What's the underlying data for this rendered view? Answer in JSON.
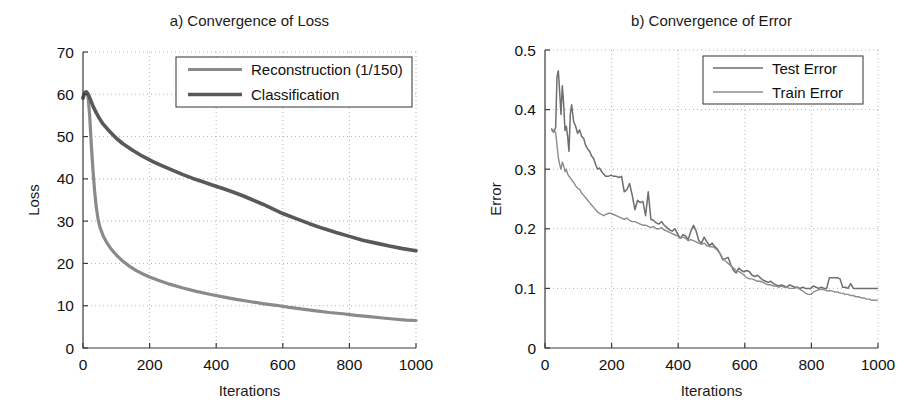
{
  "figure": {
    "background": "#ffffff",
    "width": 918,
    "height": 418
  },
  "chart_data": [
    {
      "type": "line",
      "panel_id": "a",
      "title": "a) Convergence of Loss",
      "xlabel": "Iterations",
      "ylabel": "Loss",
      "xlim": [
        0,
        1000
      ],
      "ylim": [
        0,
        70
      ],
      "xticks": [
        0,
        200,
        400,
        600,
        800,
        1000
      ],
      "xticklabels": [
        "0",
        "200",
        "400",
        "600",
        "800",
        "1000"
      ],
      "yticks": [
        0,
        10,
        20,
        30,
        40,
        50,
        60,
        70
      ],
      "yticklabels": [
        "0",
        "10",
        "20",
        "30",
        "40",
        "50",
        "60",
        "70"
      ],
      "grid": true,
      "legend_position": "upper-right",
      "series": [
        {
          "name": "Reconstruction (1/150)",
          "color": "#8a8a8a",
          "width": 3.2,
          "x": [
            0,
            5,
            10,
            15,
            20,
            25,
            30,
            35,
            40,
            45,
            50,
            60,
            70,
            80,
            90,
            100,
            120,
            140,
            160,
            180,
            200,
            230,
            260,
            300,
            340,
            380,
            420,
            460,
            500,
            540,
            580,
            620,
            660,
            700,
            740,
            780,
            820,
            860,
            900,
            940,
            970,
            1000
          ],
          "y": [
            59.0,
            60.3,
            60.5,
            59.6,
            55.0,
            48.0,
            42.0,
            37.0,
            33.2,
            30.6,
            28.8,
            26.6,
            25.1,
            23.9,
            22.9,
            22.0,
            20.5,
            19.3,
            18.3,
            17.5,
            16.8,
            15.9,
            15.1,
            14.2,
            13.4,
            12.7,
            12.1,
            11.5,
            11.0,
            10.5,
            10.1,
            9.6,
            9.2,
            8.8,
            8.4,
            8.1,
            7.7,
            7.4,
            7.1,
            6.8,
            6.6,
            6.5
          ]
        },
        {
          "name": "Classification",
          "color": "#595959",
          "width": 3.6,
          "x": [
            0,
            5,
            10,
            15,
            20,
            25,
            30,
            40,
            50,
            60,
            80,
            100,
            120,
            150,
            180,
            210,
            240,
            270,
            300,
            330,
            360,
            390,
            420,
            450,
            480,
            510,
            540,
            570,
            600,
            640,
            680,
            720,
            760,
            800,
            840,
            880,
            920,
            960,
            1000
          ],
          "y": [
            59.2,
            60.4,
            60.6,
            60.1,
            59.2,
            58.2,
            57.2,
            55.6,
            54.2,
            53.0,
            51.2,
            49.6,
            48.3,
            46.7,
            45.3,
            44.1,
            43.0,
            42.0,
            41.0,
            40.1,
            39.3,
            38.5,
            37.7,
            36.9,
            36.0,
            35.0,
            34.0,
            32.9,
            31.8,
            30.6,
            29.4,
            28.3,
            27.3,
            26.4,
            25.5,
            24.8,
            24.1,
            23.5,
            23.0
          ]
        }
      ]
    },
    {
      "type": "line",
      "panel_id": "b",
      "title": "b) Convergence of Error",
      "xlabel": "Iterations",
      "ylabel": "Error",
      "xlim": [
        0,
        1000
      ],
      "ylim": [
        0,
        0.5
      ],
      "xticks": [
        0,
        200,
        400,
        600,
        800,
        1000
      ],
      "xticklabels": [
        "0",
        "200",
        "400",
        "600",
        "800",
        "1000"
      ],
      "yticks": [
        0,
        0.1,
        0.2,
        0.3,
        0.4,
        0.5
      ],
      "yticklabels": [
        "0",
        "0.1",
        "0.2",
        "0.3",
        "0.4",
        "0.5"
      ],
      "grid": true,
      "legend_position": "upper-right",
      "series": [
        {
          "name": "Test Error",
          "color": "#6e6e6e",
          "width": 1.5,
          "x": [
            20,
            26,
            32,
            36,
            40,
            44,
            48,
            52,
            56,
            60,
            64,
            68,
            72,
            76,
            80,
            86,
            92,
            98,
            104,
            110,
            116,
            122,
            128,
            134,
            140,
            146,
            152,
            158,
            164,
            170,
            176,
            182,
            190,
            198,
            206,
            214,
            222,
            230,
            238,
            246,
            254,
            262,
            270,
            278,
            286,
            294,
            302,
            310,
            318,
            326,
            334,
            342,
            350,
            358,
            366,
            374,
            382,
            390,
            398,
            406,
            414,
            422,
            430,
            438,
            446,
            454,
            462,
            470,
            478,
            486,
            494,
            502,
            510,
            518,
            526,
            534,
            542,
            550,
            558,
            566,
            574,
            582,
            590,
            598,
            606,
            614,
            622,
            630,
            638,
            646,
            654,
            662,
            670,
            678,
            686,
            694,
            702,
            710,
            718,
            726,
            734,
            742,
            750,
            758,
            766,
            774,
            782,
            790,
            798,
            806,
            814,
            822,
            830,
            838,
            846,
            854,
            862,
            870,
            878,
            886,
            894,
            902,
            910,
            918,
            926,
            934,
            942,
            950,
            958,
            966,
            974,
            982,
            990,
            998
          ],
          "y": [
            0.366,
            0.362,
            0.37,
            0.455,
            0.465,
            0.43,
            0.392,
            0.44,
            0.41,
            0.365,
            0.372,
            0.355,
            0.33,
            0.392,
            0.408,
            0.38,
            0.372,
            0.36,
            0.366,
            0.355,
            0.352,
            0.34,
            0.334,
            0.33,
            0.322,
            0.318,
            0.308,
            0.3,
            0.302,
            0.296,
            0.292,
            0.288,
            0.288,
            0.29,
            0.288,
            0.288,
            0.286,
            0.288,
            0.262,
            0.266,
            0.276,
            0.256,
            0.232,
            0.248,
            0.244,
            0.246,
            0.222,
            0.262,
            0.216,
            0.214,
            0.21,
            0.208,
            0.212,
            0.206,
            0.202,
            0.198,
            0.196,
            0.2,
            0.192,
            0.184,
            0.19,
            0.188,
            0.182,
            0.196,
            0.206,
            0.196,
            0.18,
            0.176,
            0.186,
            0.178,
            0.172,
            0.176,
            0.17,
            0.166,
            0.158,
            0.148,
            0.15,
            0.152,
            0.14,
            0.13,
            0.126,
            0.134,
            0.13,
            0.128,
            0.13,
            0.128,
            0.122,
            0.12,
            0.122,
            0.118,
            0.114,
            0.112,
            0.11,
            0.112,
            0.108,
            0.106,
            0.104,
            0.106,
            0.104,
            0.102,
            0.106,
            0.104,
            0.102,
            0.102,
            0.1,
            0.102,
            0.1,
            0.1,
            0.1,
            0.104,
            0.102,
            0.1,
            0.102,
            0.1,
            0.1,
            0.118,
            0.118,
            0.118,
            0.118,
            0.116,
            0.102,
            0.102,
            0.1,
            0.108,
            0.1,
            0.1,
            0.1,
            0.1,
            0.1,
            0.1,
            0.1,
            0.1,
            0.1,
            0.1,
            0.1,
            0.104
          ]
        },
        {
          "name": "Train Error",
          "color": "#8c8c8c",
          "width": 1.4,
          "x": [
            20,
            26,
            32,
            36,
            40,
            44,
            48,
            52,
            56,
            60,
            64,
            68,
            72,
            76,
            80,
            86,
            92,
            98,
            104,
            110,
            116,
            122,
            128,
            134,
            140,
            146,
            152,
            158,
            164,
            170,
            176,
            182,
            190,
            198,
            206,
            214,
            222,
            230,
            238,
            246,
            254,
            262,
            270,
            278,
            286,
            294,
            302,
            310,
            318,
            326,
            334,
            342,
            350,
            358,
            366,
            374,
            382,
            390,
            398,
            406,
            414,
            422,
            430,
            438,
            446,
            454,
            462,
            470,
            478,
            486,
            494,
            502,
            510,
            518,
            526,
            534,
            542,
            550,
            558,
            566,
            574,
            582,
            590,
            598,
            606,
            614,
            622,
            630,
            638,
            646,
            654,
            662,
            670,
            678,
            686,
            694,
            702,
            710,
            718,
            726,
            734,
            742,
            750,
            758,
            766,
            774,
            782,
            790,
            798,
            806,
            814,
            822,
            830,
            838,
            846,
            854,
            862,
            870,
            878,
            886,
            894,
            902,
            910,
            918,
            926,
            934,
            942,
            950,
            958,
            966,
            974,
            982,
            990,
            998
          ],
          "y": [
            0.368,
            0.364,
            0.362,
            0.34,
            0.32,
            0.308,
            0.3,
            0.312,
            0.306,
            0.296,
            0.3,
            0.292,
            0.288,
            0.286,
            0.282,
            0.278,
            0.272,
            0.268,
            0.266,
            0.26,
            0.256,
            0.252,
            0.248,
            0.244,
            0.24,
            0.236,
            0.232,
            0.228,
            0.226,
            0.224,
            0.222,
            0.224,
            0.226,
            0.226,
            0.224,
            0.222,
            0.22,
            0.218,
            0.216,
            0.218,
            0.214,
            0.212,
            0.212,
            0.21,
            0.208,
            0.206,
            0.206,
            0.204,
            0.202,
            0.204,
            0.2,
            0.2,
            0.202,
            0.198,
            0.196,
            0.194,
            0.192,
            0.19,
            0.188,
            0.184,
            0.186,
            0.184,
            0.18,
            0.182,
            0.18,
            0.178,
            0.176,
            0.174,
            0.176,
            0.172,
            0.17,
            0.17,
            0.168,
            0.164,
            0.158,
            0.15,
            0.146,
            0.142,
            0.138,
            0.134,
            0.13,
            0.128,
            0.126,
            0.122,
            0.118,
            0.116,
            0.116,
            0.114,
            0.112,
            0.112,
            0.11,
            0.108,
            0.106,
            0.106,
            0.104,
            0.104,
            0.102,
            0.104,
            0.102,
            0.102,
            0.1,
            0.1,
            0.1,
            0.102,
            0.098,
            0.096,
            0.092,
            0.09,
            0.09,
            0.094,
            0.096,
            0.098,
            0.098,
            0.098,
            0.096,
            0.096,
            0.096,
            0.094,
            0.094,
            0.092,
            0.092,
            0.09,
            0.09,
            0.088,
            0.088,
            0.086,
            0.086,
            0.084,
            0.084,
            0.082,
            0.082,
            0.08,
            0.08,
            0.08,
            0.078,
            0.08
          ]
        }
      ]
    }
  ]
}
